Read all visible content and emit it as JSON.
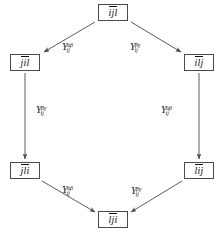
{
  "diagram": {
    "type": "commutative-hexagon",
    "canvas": {
      "width": 222,
      "height": 239,
      "background": "#ffffff"
    },
    "stroke_color": "#4a4a4a",
    "text_color": "#111111",
    "nodes": [
      {
        "id": "top",
        "label": "ijl",
        "overline": true,
        "x": 98,
        "y": 4,
        "w": 30,
        "h": 17
      },
      {
        "id": "upper-left",
        "label": "jil",
        "overline": true,
        "x": 10,
        "y": 54,
        "w": 30,
        "h": 17
      },
      {
        "id": "upper-right",
        "label": "ilj",
        "overline": true,
        "x": 184,
        "y": 54,
        "w": 30,
        "h": 17
      },
      {
        "id": "lower-left",
        "label": "jli",
        "overline": true,
        "x": 10,
        "y": 162,
        "w": 30,
        "h": 17
      },
      {
        "id": "lower-right",
        "label": "lij",
        "overline": true,
        "x": 184,
        "y": 162,
        "w": 30,
        "h": 17
      },
      {
        "id": "bottom",
        "label": "lji",
        "overline": true,
        "x": 98,
        "y": 211,
        "w": 30,
        "h": 17
      }
    ],
    "edges": [
      {
        "id": "top-to-upper-left",
        "from": "top",
        "to": "upper-left",
        "label": {
          "base": "Y",
          "sub": "ij",
          "sup": "αβ"
        },
        "label_x": 62,
        "label_y": 42,
        "x1": 95,
        "y1": 22,
        "x2": 44,
        "y2": 52
      },
      {
        "id": "top-to-upper-right",
        "from": "top",
        "to": "upper-right",
        "label": {
          "base": "Y",
          "sub": "ij",
          "sup": "βγ"
        },
        "label_x": 130,
        "label_y": 42,
        "x1": 131,
        "y1": 22,
        "x2": 181,
        "y2": 52
      },
      {
        "id": "upper-left-to-lower-left",
        "from": "upper-left",
        "to": "lower-left",
        "label": {
          "base": "Y",
          "sub": "ij",
          "sup": "βγ"
        },
        "label_x": 36,
        "label_y": 105,
        "x1": 25,
        "y1": 73,
        "x2": 25,
        "y2": 159
      },
      {
        "id": "upper-right-to-lower-right",
        "from": "upper-right",
        "to": "lower-right",
        "label": {
          "base": "Y",
          "sub": "ij",
          "sup": "αβ"
        },
        "label_x": 161,
        "label_y": 105,
        "x1": 199,
        "y1": 73,
        "x2": 199,
        "y2": 159
      },
      {
        "id": "lower-left-to-bottom",
        "from": "lower-left",
        "to": "bottom",
        "label": {
          "base": "Y",
          "sub": "ij",
          "sup": "αβ"
        },
        "label_x": 62,
        "label_y": 185,
        "x1": 42,
        "y1": 181,
        "x2": 95,
        "y2": 212
      },
      {
        "id": "lower-right-to-bottom",
        "from": "lower-right",
        "to": "bottom",
        "label": {
          "base": "Y",
          "sub": "ij",
          "sup": "βγ"
        },
        "label_x": 131,
        "label_y": 186,
        "x1": 182,
        "y1": 181,
        "x2": 131,
        "y2": 212
      }
    ]
  }
}
